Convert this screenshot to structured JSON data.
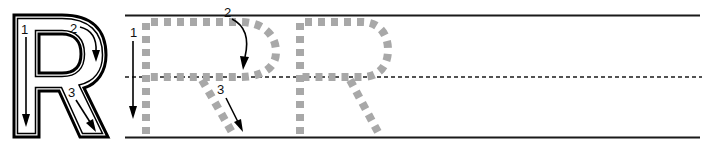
{
  "worksheet": {
    "letter": "R",
    "model_letter": {
      "style": "outline",
      "strokes": [
        {
          "number": "1",
          "direction": "down"
        },
        {
          "number": "2",
          "direction": "curve-clockwise"
        },
        {
          "number": "3",
          "direction": "diagonal-down-right"
        }
      ]
    },
    "trace_letters": [
      {
        "letter": "R",
        "style": "dashed-gray",
        "with_guides": true
      },
      {
        "letter": "R",
        "style": "dashed-gray",
        "with_guides": false
      }
    ],
    "guide_labels": {
      "stroke1": "1",
      "stroke2": "2",
      "stroke3": "3"
    },
    "lines": {
      "top": "solid",
      "middle": "dashed",
      "bottom": "solid"
    },
    "colors": {
      "line": "#1a1a1a",
      "trace": "#a8a8a8",
      "outline": "#000000"
    }
  }
}
